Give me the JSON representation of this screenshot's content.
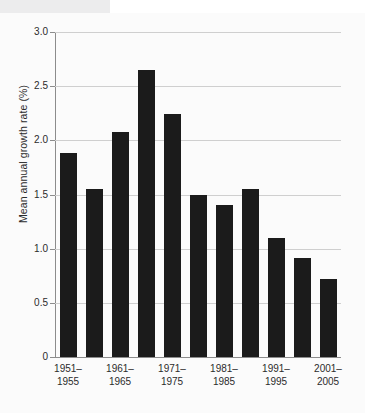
{
  "chart_data": {
    "type": "bar",
    "title": "",
    "xlabel": "",
    "ylabel": "Mean annual growth rate (%)",
    "categories": [
      "1951–1955",
      "1956–1960",
      "1961–1965",
      "1966–1970",
      "1971–1975",
      "1976–1980",
      "1981–1985",
      "1986–1990",
      "1991–1995",
      "1996–2000",
      "2001–2005"
    ],
    "values": [
      1.88,
      1.55,
      2.08,
      2.65,
      2.24,
      1.5,
      1.4,
      1.55,
      1.1,
      0.91,
      0.72
    ],
    "ylim": [
      0,
      3.0
    ],
    "yticks": [
      "0",
      "0.5",
      "1.0",
      "1.5",
      "2.0",
      "2.5",
      "3.0"
    ],
    "ytick_values": [
      0,
      0.5,
      1.0,
      1.5,
      2.0,
      2.5,
      3.0
    ],
    "visible_xtick_labels": [
      {
        "line1": "1951–",
        "line2": "1955",
        "bar_index": 0
      },
      {
        "line1": "1961–",
        "line2": "1965",
        "bar_index": 2
      },
      {
        "line1": "1971–",
        "line2": "1975",
        "bar_index": 4
      },
      {
        "line1": "1981–",
        "line2": "1985",
        "bar_index": 6
      },
      {
        "line1": "1991–",
        "line2": "1995",
        "bar_index": 8
      },
      {
        "line1": "2001–",
        "line2": "2005",
        "bar_index": 10
      }
    ],
    "grid": true,
    "legend": false,
    "bar_color": "#1b1b1b",
    "grid_color": "#cfcfcf",
    "axis_color": "#8c8c8c"
  }
}
